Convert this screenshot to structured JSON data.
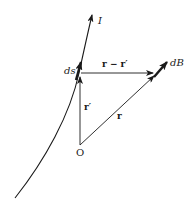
{
  "diagram": {
    "labels": {
      "current": "I",
      "ds": "ds",
      "r_minus_rprime": "r − r′",
      "dB": "dB",
      "r_prime": "r′",
      "r": "r",
      "origin": "O"
    },
    "colors": {
      "stroke": "#1a1a1a",
      "background": "#ffffff"
    }
  }
}
